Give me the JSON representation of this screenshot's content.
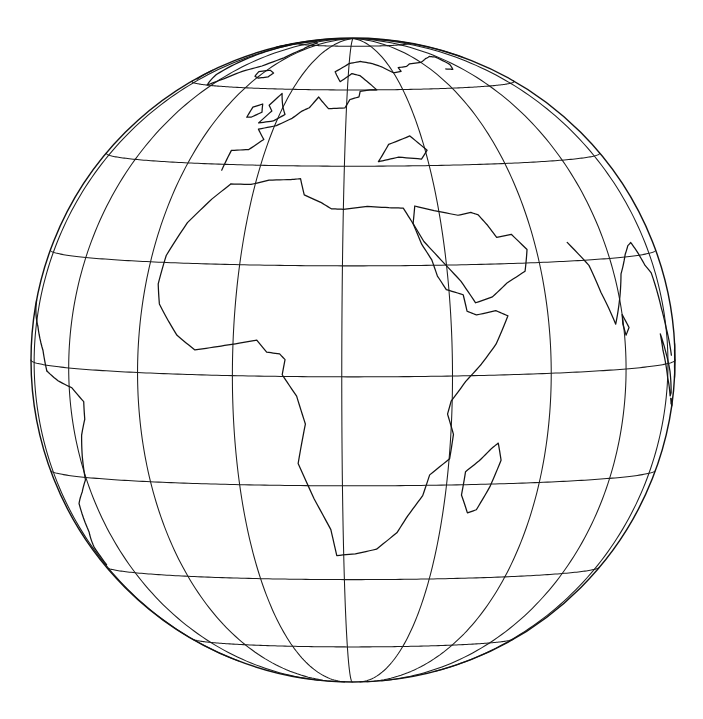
{
  "figure": {
    "kind": "map",
    "background_color": "#ffffff",
    "line_color": "#111111",
    "caption": ""
  },
  "projection": {
    "name": "orthographic",
    "center_lon": 22,
    "center_lat": 3,
    "rotation_deg": 0,
    "pixel_center_x": 353,
    "pixel_center_y": 360,
    "pixel_radius": 322
  },
  "graticule": {
    "meridian_step_deg": 20,
    "parallel_step_deg": 20,
    "meridians_deg": [
      -80,
      -60,
      -40,
      -20,
      0,
      20,
      40,
      60,
      80,
      100,
      120
    ],
    "parallels_deg": [
      -60,
      -40,
      -20,
      0,
      20,
      40,
      60,
      80
    ],
    "equator_deg": 0,
    "prime_meridian_deg": 0,
    "show_limb": true,
    "stroke_color": "#1a1a1a",
    "stroke_width": 1.05
  },
  "features": {
    "visible_landmasses": [
      "Africa",
      "Europe",
      "Greenland",
      "Arabian Peninsula",
      "Madagascar",
      "South America (eastern limb)",
      "India",
      "Maritime Southeast Asia",
      "Iceland",
      "Great Britain",
      "Sri Lanka",
      "Arctic Canada"
    ],
    "visible_waters": [
      "Atlantic Ocean",
      "Indian Ocean",
      "Mediterranean Sea",
      "Red Sea",
      "Gulf of Guinea",
      "Arabian Sea",
      "Bay of Bengal"
    ],
    "coastline_color": "#111111",
    "coastline_width": 1.25
  },
  "labels": {
    "has_text_labels": false,
    "items": []
  },
  "chart_data": {
    "type": "map",
    "projection": "orthographic",
    "center": {
      "lon": 22,
      "lat": 3
    },
    "radius_px": 322,
    "grid": true,
    "legend": "none",
    "meridians_deg": [
      -80,
      -60,
      -40,
      -20,
      0,
      20,
      40,
      60,
      80,
      100,
      120
    ],
    "parallels_deg": [
      -60,
      -40,
      -20,
      0,
      20,
      40,
      60,
      80
    ],
    "coastlines": {
      "africa": [
        [
          -5.9,
          35.8
        ],
        [
          -9.3,
          32.6
        ],
        [
          -13.5,
          27.7
        ],
        [
          -16.5,
          21.3
        ],
        [
          -17.0,
          16.0
        ],
        [
          -16.0,
          12.4
        ],
        [
          -13.6,
          9.5
        ],
        [
          -11.4,
          6.9
        ],
        [
          -7.5,
          4.4
        ],
        [
          -3.0,
          5.1
        ],
        [
          1.2,
          5.8
        ],
        [
          4.5,
          6.4
        ],
        [
          6.4,
          4.3
        ],
        [
          8.8,
          4.0
        ],
        [
          9.8,
          3.0
        ],
        [
          9.3,
          0.3
        ],
        [
          11.9,
          -3.5
        ],
        [
          13.4,
          -8.5
        ],
        [
          11.8,
          -15.8
        ],
        [
          14.5,
          -22.6
        ],
        [
          17.5,
          -28.8
        ],
        [
          18.5,
          -34.4
        ],
        [
          22.5,
          -34.0
        ],
        [
          27.0,
          -33.0
        ],
        [
          31.0,
          -29.5
        ],
        [
          32.9,
          -26.0
        ],
        [
          35.5,
          -22.0
        ],
        [
          36.5,
          -18.0
        ],
        [
          40.1,
          -15.0
        ],
        [
          40.5,
          -10.5
        ],
        [
          39.2,
          -6.8
        ],
        [
          39.8,
          -4.5
        ],
        [
          42.5,
          -1.0
        ],
        [
          45.5,
          2.0
        ],
        [
          48.5,
          5.5
        ],
        [
          51.3,
          10.5
        ],
        [
          48.9,
          11.5
        ],
        [
          45.0,
          10.8
        ],
        [
          43.2,
          11.5
        ],
        [
          42.7,
          14.5
        ],
        [
          39.5,
          15.5
        ],
        [
          38.0,
          18.0
        ],
        [
          37.2,
          21.0
        ],
        [
          35.5,
          24.0
        ],
        [
          34.2,
          28.0
        ],
        [
          32.5,
          31.1
        ],
        [
          29.5,
          31.2
        ],
        [
          25.0,
          31.5
        ],
        [
          20.0,
          30.9
        ],
        [
          17.5,
          31.0
        ],
        [
          15.2,
          32.3
        ],
        [
          11.5,
          33.8
        ],
        [
          10.2,
          37.2
        ],
        [
          8.0,
          37.0
        ],
        [
          3.0,
          36.8
        ],
        [
          -1.0,
          35.8
        ],
        [
          -5.9,
          35.8
        ]
      ],
      "europe": [
        [
          -9.5,
          38.7
        ],
        [
          -9.2,
          43.2
        ],
        [
          -4.5,
          43.5
        ],
        [
          -1.5,
          46.0
        ],
        [
          -4.3,
          48.5
        ],
        [
          0.5,
          49.5
        ],
        [
          4.3,
          51.5
        ],
        [
          6.5,
          53.5
        ],
        [
          8.5,
          54.5
        ],
        [
          10.5,
          57.7
        ],
        [
          12.5,
          56.0
        ],
        [
          14.5,
          54.3
        ],
        [
          19.5,
          54.5
        ],
        [
          21.0,
          57.0
        ],
        [
          24.0,
          57.8
        ],
        [
          24.5,
          59.5
        ],
        [
          28.0,
          60.0
        ],
        [
          30.5,
          60.0
        ],
        [
          28.5,
          62.0
        ],
        [
          25.0,
          65.0
        ],
        [
          21.5,
          65.8
        ],
        [
          17.0,
          62.8
        ],
        [
          14.0,
          66.5
        ],
        [
          20.0,
          70.0
        ],
        [
          26.0,
          71.0
        ],
        [
          32.0,
          70.0
        ],
        [
          36.0,
          68.5
        ],
        [
          40.0,
          66.0
        ],
        [
          44.0,
          66.5
        ],
        [
          44.0,
          68.0
        ],
        [
          49.0,
          68.5
        ],
        [
          52.0,
          69.5
        ],
        [
          60.0,
          70.0
        ],
        [
          67.0,
          71.5
        ],
        [
          74.0,
          72.5
        ],
        [
          78.0,
          72.0
        ],
        [
          77.0,
          68.5
        ],
        [
          73.0,
          66.5
        ],
        [
          69.0,
          66.8
        ]
      ],
      "black_sea_caspian": [
        [
          28.0,
          41.0
        ],
        [
          31.0,
          45.0
        ],
        [
          37.0,
          47.0
        ],
        [
          40.5,
          43.5
        ],
        [
          38.5,
          41.5
        ],
        [
          33.0,
          42.0
        ],
        [
          29.0,
          41.2
        ],
        [
          28.0,
          41.0
        ]
      ],
      "arabia": [
        [
          34.2,
          28.0
        ],
        [
          36.0,
          24.5
        ],
        [
          39.0,
          21.0
        ],
        [
          42.5,
          17.0
        ],
        [
          45.0,
          13.0
        ],
        [
          48.5,
          14.0
        ],
        [
          52.0,
          16.5
        ],
        [
          56.3,
          18.5
        ],
        [
          57.8,
          22.5
        ],
        [
          55.0,
          25.5
        ],
        [
          51.5,
          25.0
        ],
        [
          50.0,
          27.5
        ],
        [
          48.5,
          29.5
        ],
        [
          47.0,
          30.0
        ],
        [
          44.0,
          29.5
        ],
        [
          39.0,
          30.5
        ],
        [
          35.0,
          31.5
        ],
        [
          34.2,
          28.0
        ]
      ],
      "india": [
        [
          68.5,
          23.5
        ],
        [
          72.8,
          19.0
        ],
        [
          74.5,
          14.0
        ],
        [
          77.5,
          8.1
        ],
        [
          80.3,
          13.0
        ],
        [
          82.5,
          17.0
        ],
        [
          86.5,
          20.5
        ],
        [
          89.0,
          22.0
        ],
        [
          91.0,
          22.5
        ],
        [
          92.5,
          20.8
        ],
        [
          94.5,
          18.0
        ],
        [
          97.0,
          16.5
        ],
        [
          98.5,
          10.0
        ],
        [
          100.0,
          6.5
        ],
        [
          103.5,
          1.3
        ]
      ],
      "madagascar": [
        [
          49.5,
          -12.3
        ],
        [
          50.5,
          -15.5
        ],
        [
          49.0,
          -20.5
        ],
        [
          47.0,
          -25.0
        ],
        [
          45.2,
          -25.6
        ],
        [
          43.3,
          -22.0
        ],
        [
          43.5,
          -17.5
        ],
        [
          46.0,
          -15.5
        ],
        [
          48.3,
          -13.2
        ],
        [
          49.5,
          -12.3
        ]
      ],
      "sri_lanka": [
        [
          80.0,
          9.7
        ],
        [
          81.8,
          7.3
        ],
        [
          80.5,
          6.0
        ],
        [
          79.8,
          8.0
        ],
        [
          80.0,
          9.7
        ]
      ],
      "great_britain": [
        [
          -5.2,
          50.1
        ],
        [
          -3.0,
          53.4
        ],
        [
          -5.0,
          55.0
        ],
        [
          -3.0,
          58.6
        ],
        [
          0.0,
          54.5
        ],
        [
          1.7,
          52.5
        ],
        [
          -1.0,
          50.7
        ],
        [
          -5.2,
          50.1
        ]
      ],
      "ireland": [
        [
          -10.0,
          51.5
        ],
        [
          -10.2,
          54.3
        ],
        [
          -7.5,
          55.3
        ],
        [
          -6.0,
          53.0
        ],
        [
          -8.5,
          51.6
        ],
        [
          -10.0,
          51.5
        ]
      ],
      "iceland": [
        [
          -22.0,
          64.0
        ],
        [
          -23.5,
          65.8
        ],
        [
          -18.0,
          66.5
        ],
        [
          -14.5,
          65.5
        ],
        [
          -15.0,
          64.0
        ],
        [
          -19.0,
          63.4
        ],
        [
          -22.0,
          64.0
        ]
      ],
      "greenland": [
        [
          -43.0,
          60.0
        ],
        [
          -50.0,
          63.5
        ],
        [
          -53.5,
          68.5
        ],
        [
          -56.0,
          72.0
        ],
        [
          -60.0,
          76.0
        ],
        [
          -66.0,
          79.5
        ],
        [
          -58.0,
          82.0
        ],
        [
          -45.0,
          83.0
        ],
        [
          -30.0,
          82.0
        ],
        [
          -22.0,
          77.0
        ],
        [
          -22.0,
          72.0
        ],
        [
          -27.0,
          68.0
        ],
        [
          -34.0,
          65.5
        ],
        [
          -38.0,
          62.5
        ],
        [
          -43.0,
          60.0
        ]
      ],
      "arctic_canada": [
        [
          -65.0,
          61.0
        ],
        [
          -72.0,
          63.0
        ],
        [
          -78.0,
          66.0
        ],
        [
          -82.0,
          70.0
        ],
        [
          -85.0,
          73.5
        ],
        [
          -80.0,
          76.0
        ],
        [
          -72.0,
          78.0
        ],
        [
          -66.0,
          80.0
        ]
      ],
      "south_america": [
        [
          -50.0,
          -1.0
        ],
        [
          -44.5,
          -2.5
        ],
        [
          -39.0,
          -3.5
        ],
        [
          -35.2,
          -5.8
        ],
        [
          -35.5,
          -9.0
        ],
        [
          -37.5,
          -12.0
        ],
        [
          -39.0,
          -16.0
        ],
        [
          -40.5,
          -20.5
        ],
        [
          -44.0,
          -23.0
        ],
        [
          -48.5,
          -25.5
        ],
        [
          -52.0,
          -31.5
        ],
        [
          -57.0,
          -35.0
        ],
        [
          -58.0,
          -39.0
        ]
      ],
      "south_america_north": [
        [
          -50.0,
          -1.0
        ],
        [
          -52.5,
          2.5
        ],
        [
          -58.0,
          6.5
        ],
        [
          -62.5,
          8.5
        ],
        [
          -67.0,
          10.5
        ],
        [
          -72.0,
          11.5
        ],
        [
          -74.5,
          11.0
        ]
      ],
      "borneo_sumatra": [
        [
          95.5,
          5.5
        ],
        [
          98.5,
          2.0
        ],
        [
          102.0,
          -1.5
        ],
        [
          105.0,
          -5.5
        ],
        [
          104.0,
          -6.0
        ],
        [
          100.0,
          -2.5
        ],
        [
          96.5,
          2.5
        ],
        [
          95.5,
          5.5
        ]
      ],
      "java": [
        [
          105.5,
          -6.5
        ],
        [
          110.0,
          -7.8
        ],
        [
          114.5,
          -8.5
        ],
        [
          112.0,
          -8.3
        ],
        [
          107.0,
          -7.5
        ],
        [
          105.5,
          -6.5
        ]
      ],
      "borneo": [
        [
          109.5,
          1.8
        ],
        [
          113.0,
          3.5
        ],
        [
          117.5,
          4.5
        ],
        [
          118.5,
          0.5
        ],
        [
          116.0,
          -3.5
        ],
        [
          111.0,
          -3.0
        ],
        [
          109.0,
          -1.0
        ],
        [
          109.5,
          1.8
        ]
      ]
    }
  }
}
